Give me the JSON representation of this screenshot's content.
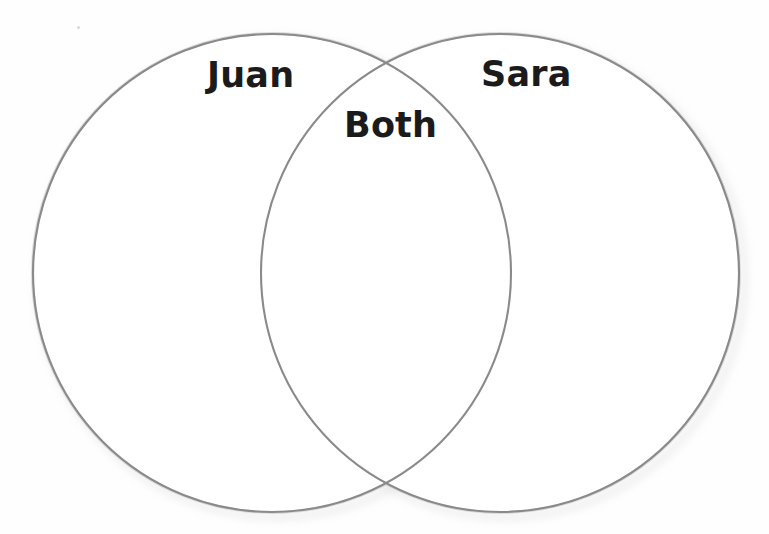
{
  "page": {
    "background_color": "#fefefe"
  },
  "diagram": {
    "type": "venn-2-circle",
    "stroke_color": "#8a8a8a",
    "stroke_width": 2,
    "fill_color": "#ffffff",
    "shadow_color": "#b9b9b9",
    "label_color": "#1b1b1b",
    "left_circle": {
      "name": "left-circle",
      "label": "Juan",
      "cx": 272,
      "cy": 273,
      "r": 239
    },
    "right_circle": {
      "name": "right-circle",
      "label": "Sara",
      "cx": 500,
      "cy": 273,
      "r": 239
    },
    "intersection": {
      "name": "intersection-region",
      "label": "Both",
      "top_crossing_x": 386,
      "top_crossing_y": 62,
      "bottom_crossing_x": 386,
      "bottom_crossing_y": 484
    },
    "labels": [
      {
        "id": "juan",
        "text": "Juan",
        "x": 207,
        "y": 55
      },
      {
        "id": "sara",
        "text": "Sara",
        "x": 481,
        "y": 54
      },
      {
        "id": "both",
        "text": "Both",
        "x": 344,
        "y": 105
      }
    ]
  }
}
